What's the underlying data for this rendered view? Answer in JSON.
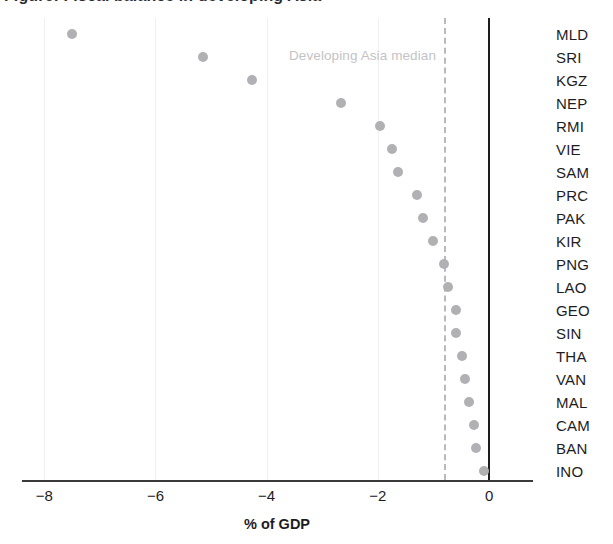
{
  "title": {
    "text": "Figure: Fiscal balance in developing Asia",
    "clipped": true
  },
  "chart_data": {
    "type": "scatter",
    "title": "Figure: Fiscal balance in developing Asia",
    "xlabel": "% of GDP",
    "ylabel": "",
    "xlim": [
      -8.4,
      0.79
    ],
    "grid": true,
    "legend": null,
    "orientation": "horizontal-dotplot",
    "categories": [
      "MLD",
      "SRI",
      "KGZ",
      "NEP",
      "RMI",
      "VIE",
      "SAM",
      "PRC",
      "PAK",
      "KIR",
      "PNG",
      "LAO",
      "GEO",
      "SIN",
      "THA",
      "VAN",
      "MAL",
      "CAM",
      "BAN",
      "INO"
    ],
    "values": [
      -7.5,
      -5.15,
      -4.27,
      -2.66,
      -1.97,
      -1.75,
      -1.63,
      -1.29,
      -1.18,
      -1.0,
      -0.81,
      -0.74,
      -0.6,
      -0.6,
      -0.48,
      -0.43,
      -0.36,
      -0.27,
      -0.24,
      -0.1
    ],
    "xticks": [
      -8,
      -6,
      -4,
      -2,
      0
    ],
    "xtick_labels": [
      "−8",
      "−6",
      "−4",
      "−2",
      "0"
    ],
    "reference_lines": [
      {
        "name": "developing-asia-median",
        "value": -0.81,
        "style": "dashed",
        "label": "Developing Asia median",
        "color": "#b9b9bd"
      },
      {
        "name": "zero-line",
        "value": 0,
        "style": "solid",
        "label": "",
        "color": "#1d1d1f"
      }
    ],
    "marker": {
      "shape": "circle",
      "color": "#b1b1b3",
      "size": 10
    }
  },
  "axis": {
    "x_title": "% of GDP"
  }
}
